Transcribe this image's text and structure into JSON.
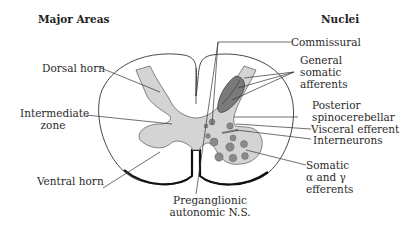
{
  "headers": {
    "left": "Major Areas",
    "right": "Nuclei"
  },
  "labels_left": {
    "dorsal_horn": "Dorsal horn",
    "intermediate_zone_1": "Intermediate",
    "intermediate_zone_2": "zone",
    "ventral_horn": "Ventral horn"
  },
  "labels_bottom": {
    "preganglionic_1": "Preganglionic",
    "preganglionic_2": "autonomic N.S."
  },
  "labels_right": {
    "commissural": "Commissural",
    "general_somatic_1": "General",
    "general_somatic_2": "somatic",
    "general_somatic_3": "afferents",
    "posterior_1": "Posterior",
    "posterior_2": "spinocerebellar",
    "visceral_efferent": "Visceral efferent",
    "interneurons": "Interneurons",
    "somatic_1": "Somatic",
    "somatic_2": "α and γ",
    "somatic_3": "efferents"
  },
  "colors": {
    "outline": "#333333",
    "gray_matter": "#d4d4d4",
    "dark_nucleus": "#7a7a7a",
    "motor_nuclei": "#8a8a8a"
  }
}
